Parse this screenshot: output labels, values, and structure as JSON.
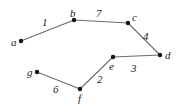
{
  "figure": {
    "type": "weighted-undirected-graph",
    "background_color": "#ffffff",
    "edge_color": "#6b6b6b",
    "node_color": "#111111",
    "label_color": "#1a1a1a",
    "width": 179,
    "height": 110
  },
  "nodes": [
    {
      "id": "a",
      "label": "a",
      "x": 21,
      "y": 41,
      "label_x": 11,
      "label_y": 37
    },
    {
      "id": "b",
      "label": "b",
      "x": 74,
      "y": 20,
      "label_x": 70,
      "label_y": 8
    },
    {
      "id": "c",
      "label": "c",
      "x": 128,
      "y": 23,
      "label_x": 132,
      "label_y": 12
    },
    {
      "id": "d",
      "label": "d",
      "x": 160,
      "y": 55,
      "label_x": 165,
      "label_y": 50
    },
    {
      "id": "e",
      "label": "e",
      "x": 113,
      "y": 57,
      "label_x": 109,
      "label_y": 61
    },
    {
      "id": "f",
      "label": "f",
      "x": 80,
      "y": 89,
      "label_x": 78,
      "label_y": 93
    },
    {
      "id": "g",
      "label": "g",
      "x": 37,
      "y": 72,
      "label_x": 27,
      "label_y": 67
    }
  ],
  "edges": [
    {
      "from": "a",
      "to": "b",
      "weight": "1",
      "label_x": 42,
      "label_y": 17
    },
    {
      "from": "b",
      "to": "c",
      "weight": "7",
      "label_x": 96,
      "label_y": 8
    },
    {
      "from": "c",
      "to": "d",
      "weight": "4",
      "label_x": 143,
      "label_y": 31
    },
    {
      "from": "e",
      "to": "d",
      "weight": "3",
      "label_x": 131,
      "label_y": 63
    },
    {
      "from": "e",
      "to": "f",
      "weight": "2",
      "label_x": 97,
      "label_y": 74
    },
    {
      "from": "g",
      "to": "f",
      "weight": "6",
      "label_x": 53,
      "label_y": 84
    }
  ]
}
